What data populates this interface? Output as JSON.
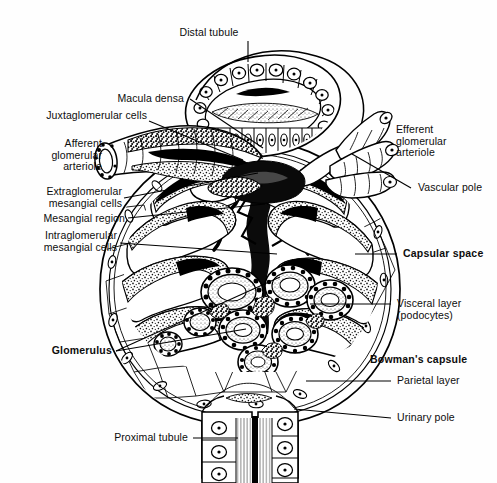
{
  "figure": {
    "width": 497,
    "height": 483,
    "background_color": "#fefefe",
    "ink_color": "#000000",
    "style": "black-and-white line drawing / stipple histology illustration"
  },
  "labels": [
    {
      "id": "distal-tubule",
      "text": "Distal tubule",
      "bold": false,
      "align": "center",
      "x": 209,
      "y": 27,
      "leader": {
        "type": "line",
        "x1": 248,
        "y1": 41,
        "x2": 248,
        "y2": 62
      }
    },
    {
      "id": "macula-densa",
      "text": "Macula densa",
      "bold": false,
      "align": "right",
      "x": 44,
      "y": 94,
      "leader": {
        "type": "line",
        "x1": 190,
        "y1": 99,
        "x2": 263,
        "y2": 148
      }
    },
    {
      "id": "juxtaglomerular-cells",
      "text": "Juxtaglomerular cells",
      "bold": false,
      "align": "right",
      "x": 24,
      "y": 110,
      "leader": {
        "type": "line",
        "x1": 149,
        "y1": 121,
        "x2": 243,
        "y2": 160
      }
    },
    {
      "id": "afferent-glomerular-arteriole",
      "text": "Afferent\nglomerular\narteriole",
      "bold": false,
      "align": "right",
      "x": 22,
      "y": 141,
      "leader": null
    },
    {
      "id": "extraglomerular-mesangial-cells",
      "text": "Extraglomerular\nmesangial cells",
      "bold": false,
      "align": "right",
      "x": 22,
      "y": 187,
      "leader": {
        "type": "line",
        "x1": 124,
        "y1": 198,
        "x2": 258,
        "y2": 173
      }
    },
    {
      "id": "mesangial-region",
      "text": "Mesangial region",
      "bold": false,
      "align": "right",
      "x": 22,
      "y": 214,
      "leader": {
        "type": "line",
        "x1": 128,
        "y1": 218,
        "x2": 265,
        "y2": 204
      }
    },
    {
      "id": "intraglomerular-mesangial-cells",
      "text": "Intraglomerular\nmesangial cells",
      "bold": false,
      "align": "right",
      "x": 22,
      "y": 231,
      "leader": {
        "type": "line",
        "x1": 120,
        "y1": 243,
        "x2": 277,
        "y2": 254
      }
    },
    {
      "id": "glomerulus",
      "text": "Glomerulus",
      "bold": true,
      "align": "right",
      "x": 44,
      "y": 346,
      "leader": {
        "type": "fork",
        "x0": 116,
        "y0": 351,
        "x1": 280,
        "y1": 277,
        "x2": 246,
        "y2": 329
      }
    },
    {
      "id": "proximal-tubule",
      "text": "Proximal tubule",
      "bold": false,
      "align": "right",
      "x": 110,
      "y": 433,
      "leader": {
        "type": "line",
        "x1": 193,
        "y1": 438,
        "x2": 238,
        "y2": 438
      }
    },
    {
      "id": "efferent-glomerular-arteriole",
      "text": "Efferent\nglomerular\narteriole",
      "bold": false,
      "align": "left",
      "x": 396,
      "y": 129,
      "leader": null
    },
    {
      "id": "vascular-pole",
      "text": "Vascular pole",
      "bold": false,
      "align": "left",
      "x": 418,
      "y": 183,
      "leader": {
        "type": "line",
        "x1": 411,
        "y1": 188,
        "x2": 352,
        "y2": 154
      }
    },
    {
      "id": "capsular-space",
      "text": "Capsular space",
      "bold": true,
      "align": "left",
      "x": 403,
      "y": 248,
      "leader": {
        "type": "line",
        "x1": 397,
        "y1": 254,
        "x2": 355,
        "y2": 254
      }
    },
    {
      "id": "visceral-layer-podocytes",
      "text": "Visceral layer\n(podocytes)",
      "bold": false,
      "align": "left",
      "x": 397,
      "y": 300,
      "leader": {
        "type": "line",
        "x1": 391,
        "y1": 304,
        "x2": 310,
        "y2": 304
      }
    },
    {
      "id": "bowmans-capsule",
      "text": "Bowman's capsule",
      "bold": true,
      "align": "left",
      "x": 370,
      "y": 354,
      "leader": null
    },
    {
      "id": "parietal-layer",
      "text": "Parietal layer",
      "bold": false,
      "align": "left",
      "x": 397,
      "y": 377,
      "leader": {
        "type": "line",
        "x1": 391,
        "y1": 381,
        "x2": 306,
        "y2": 381
      }
    },
    {
      "id": "urinary-pole",
      "text": "Urinary pole",
      "bold": false,
      "align": "left",
      "x": 397,
      "y": 414,
      "leader": {
        "type": "line",
        "x1": 391,
        "y1": 418,
        "x2": 294,
        "y2": 409
      }
    }
  ],
  "structures": {
    "bowmans_capsule_outline": "large near-circular capsule, center ~ (250,290), radius ~ 148",
    "distal_tubule": "ovoid tubule cross-section at top, centered ~ (265,105), containing macula densa cells on its lower wall",
    "afferent_arteriole": "thick vessel entering from upper-left, open cut end at ~ (105,155)",
    "efferent_arteriole": "three branching finger-like vessels exiting upper-right near (350,135)",
    "glomerular_capillary_tuft": "dense stippled lobulated capillary loops filling upper two-thirds of capsule",
    "podocyte_cluster": "ring-like podocyte cell profiles with dark nuclei, cluster centered ~ (270,300)",
    "proximal_tubule": "paired columnar-epithelium tubule descending at bottom center, x 205-295, y 395-483",
    "urinary_pole": "junction of parietal layer with proximal tubule at lower center-right ~ (294,409)",
    "vascular_pole": "entry/exit point of arterioles at upper center ~ (265,165)"
  }
}
